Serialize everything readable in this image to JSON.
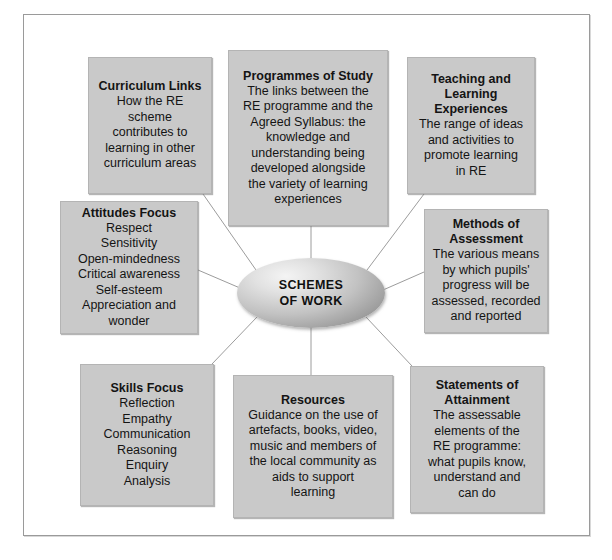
{
  "diagram": {
    "centre": {
      "label": "SCHEMES\nOF WORK"
    },
    "nodes": [
      {
        "id": "curriculum-links",
        "title": "Curriculum Links",
        "body": "How the RE\nscheme\ncontributes to\nlearning in other\ncurriculum areas"
      },
      {
        "id": "programmes-of-study",
        "title": "Programmes of Study",
        "body": "The links between the\nRE programme and the\nAgreed Syllabus: the\nknowledge and\nunderstanding being\ndeveloped alongside\nthe variety of learning\nexperiences"
      },
      {
        "id": "teaching-and-learning-experiences",
        "title": "Teaching and\nLearning\nExperiences",
        "body": "The range of ideas\nand activities to\npromote learning\nin RE"
      },
      {
        "id": "attitudes-focus",
        "title": "Attitudes Focus",
        "body": "Respect\nSensitivity\nOpen-mindedness\nCritical awareness\nSelf-esteem\nAppreciation and\nwonder"
      },
      {
        "id": "methods-of-assessment",
        "title": "Methods of\nAssessment",
        "body": "The various means\nby which pupils'\nprogress will be\nassessed, recorded\nand reported"
      },
      {
        "id": "skills-focus",
        "title": "Skills Focus",
        "body": "Reflection\nEmpathy\nCommunication\nReasoning\nEnquiry\nAnalysis"
      },
      {
        "id": "resources",
        "title": "Resources",
        "body": "Guidance on the use of\nartefacts, books, video,\nmusic and members of\nthe local community as\naids to support\nlearning"
      },
      {
        "id": "statements-of-attainment",
        "title": "Statements of\nAttainment",
        "body": "The assessable\nelements of the\nRE programme:\nwhat pupils know,\nunderstand and\ncan do"
      }
    ],
    "colors": {
      "node_fill": "#c9c9c9",
      "node_border": "#b4b4b4",
      "connector": "#9c9c9c",
      "frame_border": "#9a9a9a",
      "text": "#141414",
      "page_background": "#ffffff"
    }
  }
}
